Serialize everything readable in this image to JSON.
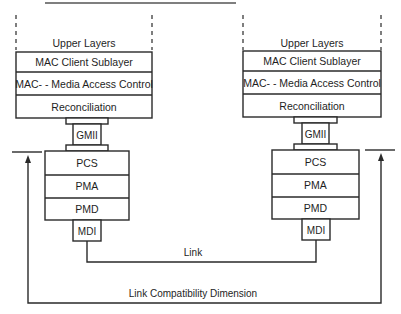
{
  "diagram": {
    "type": "protocol-stack",
    "stacks": [
      {
        "side": "left",
        "upper_layers": "Upper Layers",
        "layers": [
          "MAC Client Sublayer",
          "MAC- - Media Access Control",
          "Reconciliation"
        ],
        "interface": "GMII",
        "phy_layers": [
          "PCS",
          "PMA",
          "PMD"
        ],
        "mdi": "MDI"
      },
      {
        "side": "right",
        "upper_layers": "Upper Layers",
        "layers": [
          "MAC Client Sublayer",
          "MAC- - Media Access Control",
          "Reconciliation"
        ],
        "interface": "GMII",
        "phy_layers": [
          "PCS",
          "PMA",
          "PMD"
        ],
        "mdi": "MDI"
      }
    ],
    "link_label": "Link",
    "compatibility_label": "Link Compatibility Dimension",
    "colors": {
      "stroke": "#2a2a2a",
      "text": "#1e1e1e",
      "background": "#ffffff"
    }
  }
}
